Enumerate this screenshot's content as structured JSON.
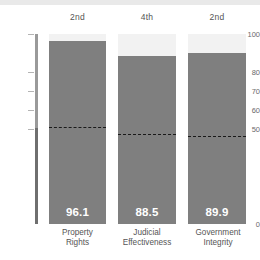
{
  "chart_data": {
    "type": "bar",
    "title": "",
    "subtitle": "",
    "xlabel": "",
    "ylabel": "",
    "ylim": [
      0,
      100
    ],
    "grid": false,
    "legend": "none",
    "categories": [
      "Property\nRights",
      "Judicial\nEffectiveness",
      "Government\nIntegrity"
    ],
    "category_lines": [
      [
        "Property",
        "Rights"
      ],
      [
        "Judicial",
        "Effectiveness"
      ],
      [
        "Government",
        "Integrity"
      ]
    ],
    "values": [
      96.1,
      88.5,
      89.9
    ],
    "value_labels": [
      "96.1",
      "88.5",
      "89.9"
    ],
    "ranks": [
      "2nd",
      "4th",
      "2nd"
    ],
    "reference_lines": {
      "label": "world average",
      "values": [
        51.0,
        47.5,
        46.5
      ],
      "style": "dashed"
    },
    "y_ticks": [
      100,
      80,
      70,
      60,
      50,
      0
    ],
    "y_tick_labels": [
      "100",
      "80",
      "70",
      "60",
      "50",
      "0"
    ],
    "track_max": 100
  },
  "colors": {
    "bar": "#7f7f7f",
    "track": "#f2f2f2",
    "axis": "#9a9a9a",
    "axis_dark": "#6f6f6f",
    "reference_line": "#1a1a1a",
    "value_text": "#ffffff",
    "label_text": "#555555",
    "tick_text": "#6a6a6a",
    "background": "#ffffff",
    "top_strip": "#e9e9e9"
  }
}
